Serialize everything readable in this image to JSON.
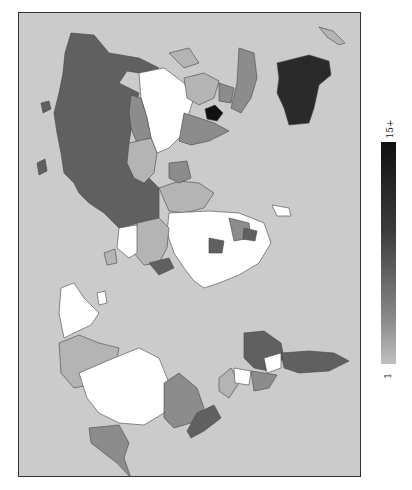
{
  "map": {
    "type": "choropleth",
    "projection": "world map rotated 90° clockwise (north at left)",
    "ocean_color": "#cbcbcb",
    "scale": [
      "#ffffff",
      "#b4b4b4",
      "#8c8c8c",
      "#606060",
      "#3c3c3c",
      "#111111"
    ],
    "regions": [
      {
        "name": "Russia",
        "shade": "#606060"
      },
      {
        "name": "China",
        "shade": "#ffffff"
      },
      {
        "name": "Mongolia",
        "shade": "#8c8c8c"
      },
      {
        "name": "Australia",
        "shade": "#2a2a2a"
      },
      {
        "name": "Indonesia",
        "shade": "#8c8c8c"
      },
      {
        "name": "India",
        "shade": "#8c8c8c"
      },
      {
        "name": "Kazakhstan",
        "shade": "#b4b4b4"
      },
      {
        "name": "Greenland",
        "shade": "#ffffff"
      },
      {
        "name": "Canada",
        "shade": "#ffffff"
      },
      {
        "name": "Canadian Arctic Islands",
        "shade": "#b4b4b4"
      },
      {
        "name": "USA",
        "shade": "#8c8c8c"
      },
      {
        "name": "Alaska",
        "shade": "#8c8c8c"
      },
      {
        "name": "Mexico",
        "shade": "#606060"
      },
      {
        "name": "Brazil",
        "shade": "#606060"
      },
      {
        "name": "Argentina",
        "shade": "#606060"
      },
      {
        "name": "Africa (most countries)",
        "shade": "#ffffff"
      },
      {
        "name": "Europe (mixed)",
        "shade": "#b4b4b4"
      }
    ]
  },
  "colorbar": {
    "min_label": "1",
    "max_label": "15+",
    "orientation": "vertical"
  }
}
